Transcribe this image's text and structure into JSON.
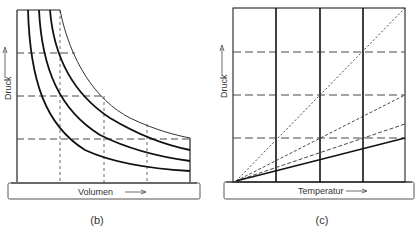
{
  "panels": [
    {
      "id": "b",
      "caption": "(b)",
      "x_label": "Volumen",
      "y_label": "Druck",
      "description": "Isothermen: Druck gegen Volumen (Boyle-Mariotte), drei dicke Hyperbeln plus eine dünne",
      "x_arrow": "→",
      "y_arrow": "→"
    },
    {
      "id": "c",
      "caption": "(c)",
      "x_label": "Temperatur",
      "y_label": "Druck",
      "description": "Isochoren: Druck gegen Temperatur, Geraden durch den Ursprung mit verschiedenen Steigungen",
      "x_arrow": "→",
      "y_arrow": "→"
    }
  ],
  "colors": {
    "line": "#1a1a1a",
    "thin": "#444444",
    "base": "#555555"
  }
}
